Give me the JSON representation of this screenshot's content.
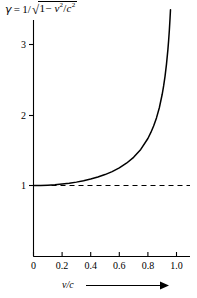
{
  "figure": {
    "title_formula": {
      "gamma": "γ",
      "equals": "=",
      "one_over": "1/",
      "radical": "√",
      "inside_one": "1",
      "minus": "−",
      "v": "v",
      "v_exp": "2",
      "slash": "/",
      "c": "c",
      "c_exp": "2",
      "plain": "γ = 1/√(1 − v²/c²)"
    },
    "ink_color": "#000000",
    "background_color": "#ffffff",
    "x_axis_caption": "v/c",
    "x_axis_arrow": "⟶"
  },
  "chart_data": {
    "type": "line",
    "xlabel": "v/c",
    "ylabel": "",
    "xlim": [
      0,
      1.1
    ],
    "ylim": [
      0,
      3.6
    ],
    "grid": false,
    "legend": null,
    "xticks": [
      0,
      0.2,
      0.4,
      0.6,
      0.8,
      1.0
    ],
    "xticklabels": [
      "0",
      "0.2",
      "0.4",
      "0.6",
      "0.8",
      "1.0"
    ],
    "yticks": [
      1,
      2,
      3
    ],
    "yticklabels": [
      "1",
      "2",
      "3"
    ],
    "series": [
      {
        "name": "gamma",
        "style": "solid",
        "x": [
          0.0,
          0.05,
          0.1,
          0.15,
          0.2,
          0.25,
          0.3,
          0.35,
          0.4,
          0.45,
          0.5,
          0.55,
          0.6,
          0.65,
          0.7,
          0.75,
          0.8,
          0.82,
          0.84,
          0.86,
          0.88,
          0.9,
          0.91,
          0.92,
          0.93,
          0.94,
          0.945,
          0.95,
          0.955,
          0.958
        ],
        "values": [
          1.0,
          1.001,
          1.005,
          1.011,
          1.021,
          1.033,
          1.048,
          1.068,
          1.091,
          1.12,
          1.155,
          1.197,
          1.25,
          1.316,
          1.4,
          1.512,
          1.667,
          1.749,
          1.845,
          1.959,
          2.103,
          2.294,
          2.412,
          2.552,
          2.721,
          2.931,
          3.057,
          3.203,
          3.375,
          3.492
        ]
      },
      {
        "name": "asymptote-gamma-equals-1",
        "style": "dashed",
        "x": [
          0.0,
          1.1
        ],
        "values": [
          1.0,
          1.0
        ]
      }
    ]
  }
}
